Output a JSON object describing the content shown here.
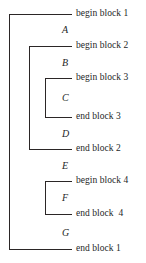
{
  "diagram": {
    "type": "block-scope-bracket-diagram",
    "line_color": "#2b2626",
    "text_color": "#241f1f",
    "background": "#ffffff",
    "rows": [
      {
        "id": "begin-block-1",
        "text": "begin block 1",
        "y": 14,
        "depth": 1
      },
      {
        "id": "begin-block-2",
        "text": "begin block 2",
        "y": 46,
        "depth": 2
      },
      {
        "id": "begin-block-3",
        "text": "begin block 3",
        "y": 78,
        "depth": 3
      },
      {
        "id": "end-block-3",
        "text": "end block 3",
        "y": 117,
        "depth": 3
      },
      {
        "id": "end-block-2",
        "text": "end block 2",
        "y": 149,
        "depth": 2
      },
      {
        "id": "begin-block-4",
        "text": "begin block 4",
        "y": 181,
        "depth": 3
      },
      {
        "id": "end-block-4",
        "text": "end block  4",
        "y": 214,
        "depth": 3
      },
      {
        "id": "end-block-1",
        "text": "end block 1",
        "y": 249,
        "depth": 1
      }
    ],
    "statements": [
      {
        "id": "statement-a",
        "label": "A",
        "x": 62,
        "y": 29
      },
      {
        "id": "statement-b",
        "label": "B",
        "x": 62,
        "y": 62
      },
      {
        "id": "statement-c",
        "label": "C",
        "x": 62,
        "y": 97
      },
      {
        "id": "statement-d",
        "label": "D",
        "x": 62,
        "y": 133
      },
      {
        "id": "statement-e",
        "label": "E",
        "x": 62,
        "y": 165
      },
      {
        "id": "statement-f",
        "label": "F",
        "x": 62,
        "y": 197
      },
      {
        "id": "statement-g",
        "label": "G",
        "x": 62,
        "y": 232
      }
    ],
    "brackets": [
      {
        "id": "bracket-block-1",
        "x": 9,
        "top": 14,
        "bottom": 249,
        "arm": 63
      },
      {
        "id": "bracket-block-2",
        "x": 29,
        "top": 46,
        "bottom": 149,
        "arm": 43
      },
      {
        "id": "bracket-block-3",
        "x": 45,
        "top": 78,
        "bottom": 117,
        "arm": 27
      },
      {
        "id": "bracket-block-4",
        "x": 45,
        "top": 181,
        "bottom": 214,
        "arm": 27
      }
    ]
  }
}
